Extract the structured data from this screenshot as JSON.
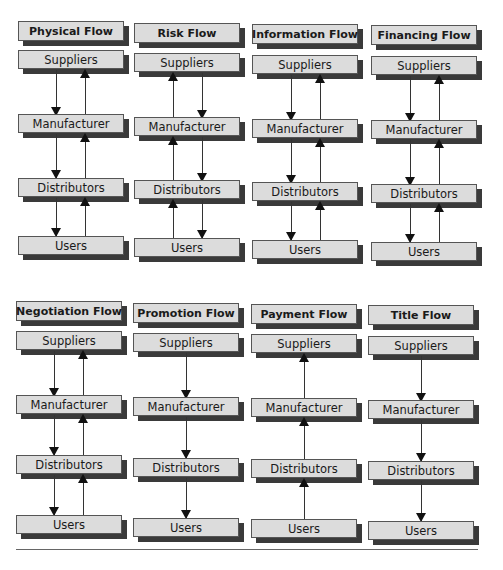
{
  "nodes": {
    "suppliers": "Suppliers",
    "manufacturer": "Manufacturer",
    "distributors": "Distributors",
    "users": "Users"
  },
  "flows": [
    {
      "title": "Physical Flow",
      "arrows": [
        "down+up",
        "down+up",
        "down+up"
      ]
    },
    {
      "title": "Risk Flow",
      "arrows": [
        "up+down",
        "up+down",
        "up+down"
      ]
    },
    {
      "title": "Information Flow",
      "arrows": [
        "down+up",
        "down+up",
        "down+up"
      ]
    },
    {
      "title": "Financing Flow",
      "arrows": [
        "down+up",
        "down+up",
        "down+up"
      ]
    },
    {
      "title": "Negotiation Flow",
      "arrows": [
        "down+up",
        "down+up",
        "down+up"
      ]
    },
    {
      "title": "Promotion Flow",
      "arrows": [
        "down",
        "down",
        "down"
      ]
    },
    {
      "title": "Payment Flow",
      "arrows": [
        "up",
        "up",
        "up"
      ]
    },
    {
      "title": "Title Flow",
      "arrows": [
        "down",
        "down",
        "down"
      ]
    }
  ],
  "colors": {
    "box_fill": "#dcdcdc",
    "box_shadow": "#3a3a3a",
    "arrow": "#111111"
  }
}
